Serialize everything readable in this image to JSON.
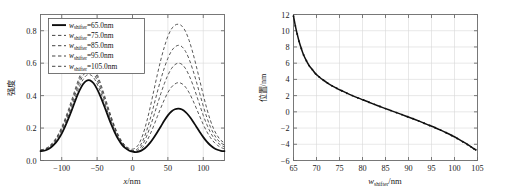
{
  "figure": {
    "title": "",
    "panels": [
      "left",
      "right"
    ]
  },
  "chart_data": [
    {
      "id": "left",
      "type": "line",
      "title": "",
      "xlabel": "x/nm",
      "ylabel": "强度",
      "xlabel_parts": {
        "symbol": "x",
        "unit": "/nm"
      },
      "xlim": [
        -130,
        130
      ],
      "ylim": [
        0.0,
        0.9
      ],
      "xticks": [
        -100,
        -50,
        0,
        50,
        100
      ],
      "xtick_labels": [
        "−100",
        "−50",
        "0",
        "50",
        "100"
      ],
      "yticks": [
        0.0,
        0.2,
        0.4,
        0.6,
        0.8
      ],
      "ytick_labels": [
        "0.0",
        "0.2",
        "0.4",
        "0.6",
        "0.8"
      ],
      "grid": true,
      "legend_position": "upper-left",
      "legend_entries": [
        {
          "label": "w_shifter =65.0nm",
          "symbol": "w",
          "subscript": "shifter",
          "value": "=65.0nm",
          "style": "solid"
        },
        {
          "label": "w_shifter =75.0nm",
          "symbol": "w",
          "subscript": "shifter",
          "value": "=75.0nm",
          "style": "dashed"
        },
        {
          "label": "w_shifter =85.0nm",
          "symbol": "w",
          "subscript": "shifter",
          "value": "=85.0nm",
          "style": "dashed"
        },
        {
          "label": "w_shifter =95.0nm",
          "symbol": "w",
          "subscript": "shifter",
          "value": "=95.0nm",
          "style": "dashed"
        },
        {
          "label": "w_shifter =105.0nm",
          "symbol": "w",
          "subscript": "shifter",
          "value": "=105.0nm",
          "style": "dashed"
        }
      ],
      "x": [
        -130,
        -125,
        -120,
        -115,
        -110,
        -105,
        -100,
        -95,
        -90,
        -85,
        -80,
        -75,
        -70,
        -65,
        -60,
        -55,
        -50,
        -45,
        -40,
        -35,
        -30,
        -25,
        -20,
        -15,
        -10,
        -5,
        0,
        5,
        10,
        15,
        20,
        25,
        30,
        35,
        40,
        45,
        50,
        55,
        60,
        65,
        70,
        75,
        80,
        85,
        90,
        95,
        100,
        105,
        110,
        115,
        120,
        125,
        130
      ],
      "series": [
        {
          "name": "w_shifter=65.0nm",
          "style": "solid",
          "left_peak": 0.495,
          "right_peak": 0.32,
          "values": [
            0.058,
            0.06,
            0.068,
            0.082,
            0.102,
            0.13,
            0.166,
            0.212,
            0.264,
            0.32,
            0.378,
            0.43,
            0.47,
            0.492,
            0.494,
            0.476,
            0.44,
            0.392,
            0.336,
            0.278,
            0.222,
            0.172,
            0.13,
            0.098,
            0.076,
            0.062,
            0.055,
            0.052,
            0.056,
            0.068,
            0.086,
            0.11,
            0.14,
            0.174,
            0.21,
            0.246,
            0.278,
            0.302,
            0.316,
            0.32,
            0.314,
            0.298,
            0.274,
            0.244,
            0.21,
            0.176,
            0.144,
            0.116,
            0.094,
            0.077,
            0.066,
            0.06,
            0.058
          ]
        },
        {
          "name": "w_shifter=75.0nm",
          "style": "dashed",
          "left_peak": 0.53,
          "right_peak": 0.48,
          "values": [
            0.06,
            0.063,
            0.072,
            0.088,
            0.11,
            0.14,
            0.18,
            0.228,
            0.283,
            0.342,
            0.402,
            0.456,
            0.498,
            0.525,
            0.529,
            0.511,
            0.472,
            0.42,
            0.36,
            0.298,
            0.238,
            0.184,
            0.139,
            0.104,
            0.08,
            0.064,
            0.056,
            0.054,
            0.062,
            0.084,
            0.118,
            0.162,
            0.214,
            0.27,
            0.324,
            0.375,
            0.419,
            0.452,
            0.472,
            0.48,
            0.473,
            0.452,
            0.418,
            0.374,
            0.324,
            0.272,
            0.222,
            0.178,
            0.142,
            0.114,
            0.094,
            0.08,
            0.072
          ]
        },
        {
          "name": "w_shifter=85.0nm",
          "style": "dashed",
          "left_peak": 0.556,
          "right_peak": 0.6,
          "values": [
            0.062,
            0.065,
            0.075,
            0.092,
            0.116,
            0.148,
            0.19,
            0.24,
            0.297,
            0.358,
            0.42,
            0.478,
            0.522,
            0.551,
            0.555,
            0.536,
            0.495,
            0.441,
            0.378,
            0.313,
            0.25,
            0.193,
            0.146,
            0.109,
            0.083,
            0.067,
            0.058,
            0.058,
            0.072,
            0.104,
            0.15,
            0.208,
            0.274,
            0.344,
            0.412,
            0.474,
            0.526,
            0.566,
            0.591,
            0.6,
            0.592,
            0.566,
            0.524,
            0.47,
            0.408,
            0.342,
            0.278,
            0.222,
            0.174,
            0.138,
            0.112,
            0.094,
            0.084
          ]
        },
        {
          "name": "w_shifter=95.0nm",
          "style": "dashed",
          "left_peak": 0.578,
          "right_peak": 0.71,
          "values": [
            0.064,
            0.067,
            0.078,
            0.096,
            0.121,
            0.155,
            0.198,
            0.25,
            0.309,
            0.372,
            0.437,
            0.497,
            0.543,
            0.573,
            0.577,
            0.557,
            0.515,
            0.458,
            0.393,
            0.325,
            0.26,
            0.201,
            0.152,
            0.113,
            0.087,
            0.07,
            0.062,
            0.066,
            0.086,
            0.126,
            0.184,
            0.256,
            0.337,
            0.421,
            0.5,
            0.571,
            0.63,
            0.674,
            0.7,
            0.71,
            0.701,
            0.672,
            0.625,
            0.562,
            0.49,
            0.412,
            0.336,
            0.266,
            0.208,
            0.163,
            0.13,
            0.108,
            0.096
          ]
        },
        {
          "name": "w_shifter=105.0nm",
          "style": "dashed",
          "left_peak": 0.598,
          "right_peak": 0.84,
          "values": [
            0.066,
            0.07,
            0.081,
            0.1,
            0.126,
            0.161,
            0.206,
            0.26,
            0.321,
            0.386,
            0.453,
            0.515,
            0.563,
            0.593,
            0.597,
            0.577,
            0.533,
            0.474,
            0.407,
            0.337,
            0.269,
            0.208,
            0.157,
            0.118,
            0.091,
            0.075,
            0.07,
            0.08,
            0.11,
            0.164,
            0.238,
            0.328,
            0.428,
            0.528,
            0.62,
            0.7,
            0.765,
            0.81,
            0.834,
            0.84,
            0.828,
            0.795,
            0.74,
            0.668,
            0.584,
            0.494,
            0.404,
            0.32,
            0.248,
            0.192,
            0.152,
            0.124,
            0.108
          ]
        }
      ]
    },
    {
      "id": "right",
      "type": "line",
      "title": "",
      "xlabel": "w_shifter/nm",
      "xlabel_parts": {
        "symbol": "w",
        "subscript": "shifter",
        "unit": "/nm"
      },
      "ylabel": "位置 /nm",
      "ylabel_parts": {
        "cjk": "位置",
        "unit": "/nm"
      },
      "xlim": [
        65,
        105
      ],
      "ylim": [
        -6,
        12
      ],
      "xticks": [
        65,
        70,
        75,
        80,
        85,
        90,
        95,
        100,
        105
      ],
      "xtick_labels": [
        "65",
        "70",
        "75",
        "80",
        "85",
        "90",
        "95",
        "100",
        "105"
      ],
      "yticks": [
        -6,
        -4,
        -2,
        0,
        2,
        4,
        6,
        8,
        10,
        12
      ],
      "ytick_labels": [
        "−6",
        "−4",
        "−2",
        "0",
        "2",
        "4",
        "6",
        "8",
        "10",
        "12"
      ],
      "grid": true,
      "markers": "dot",
      "series": [
        {
          "name": "position",
          "style": "solid-with-markers",
          "x": [
            65.0,
            65.4,
            65.8,
            66.2,
            66.7,
            67.2,
            67.8,
            68.4,
            69.1,
            69.8,
            70.6,
            71.5,
            72.4,
            73.4,
            74.4,
            75.5,
            76.6,
            77.8,
            79.0,
            80.2,
            81.4,
            82.6,
            83.8,
            85.0,
            86.2,
            87.4,
            88.6,
            89.8,
            91.0,
            92.2,
            93.4,
            94.6,
            95.8,
            97.0,
            98.2,
            99.4,
            100.6,
            101.8,
            102.8,
            103.6,
            104.2,
            104.6
          ],
          "values": [
            11.8,
            10.6,
            9.6,
            8.7,
            7.8,
            7.0,
            6.3,
            5.7,
            5.2,
            4.7,
            4.3,
            3.9,
            3.55,
            3.2,
            2.9,
            2.6,
            2.3,
            2.0,
            1.72,
            1.45,
            1.18,
            0.92,
            0.66,
            0.4,
            0.15,
            -0.1,
            -0.35,
            -0.6,
            -0.85,
            -1.12,
            -1.4,
            -1.68,
            -1.96,
            -2.26,
            -2.58,
            -2.92,
            -3.28,
            -3.68,
            -4.02,
            -4.32,
            -4.55,
            -4.68
          ]
        }
      ]
    }
  ]
}
